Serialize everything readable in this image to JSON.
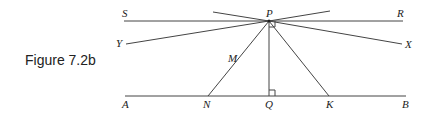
{
  "figure": {
    "caption": "Figure 7.2b",
    "points": {
      "S": "S",
      "P": "P",
      "R": "R",
      "Y": "Y",
      "X": "X",
      "M": "M",
      "A": "A",
      "N": "N",
      "Q": "Q",
      "K": "K",
      "B": "B"
    }
  }
}
